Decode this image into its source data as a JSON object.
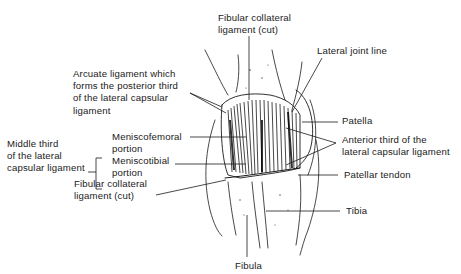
{
  "figure": {
    "labels": {
      "fibular_collateral_top": [
        "Fibular collateral",
        "ligament (cut)"
      ],
      "lateral_joint_line": "Lateral joint line",
      "arcuate": [
        "Arcuate ligament which",
        "forms the posterior third",
        "of the lateral capsular",
        "ligament"
      ],
      "patella": "Patella",
      "middle_third": [
        "Middle third",
        "of the lateral",
        "capsular ligament"
      ],
      "meniscofemoral": [
        "Meniscofemoral",
        "portion"
      ],
      "meniscotibial": [
        "Meniscotibial",
        "portion"
      ],
      "anterior_third": [
        "Anterior third of the",
        "lateral capsular ligament"
      ],
      "fibular_collateral_bottom": [
        "Fibular collateral",
        "ligament (cut)"
      ],
      "patellar_tendon": "Patellar tendon",
      "tibia": "Tibia",
      "fibula": "Fibula"
    },
    "colors": {
      "ink": "#1a1a1a",
      "background": "#ffffff"
    }
  }
}
